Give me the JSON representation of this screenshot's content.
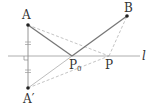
{
  "diagram": {
    "colors": {
      "line": "#999999",
      "solid_path": "#777777",
      "dashed": "#aaaaaa",
      "point": "#222222",
      "text": "#333333"
    },
    "points": {
      "A": {
        "label": "A",
        "x": 28,
        "y": 25
      },
      "A_prime": {
        "label": "A′",
        "x": 28,
        "y": 88
      },
      "B": {
        "label": "B",
        "x": 127,
        "y": 16
      },
      "P0": {
        "label": "P",
        "sub": "0",
        "x": 72,
        "y": 56
      },
      "P": {
        "label": "P",
        "x": 109,
        "y": 56
      }
    },
    "line_l": {
      "label": "l",
      "x1": 8,
      "x2": 140,
      "y": 56
    },
    "segments": [
      {
        "from": "A",
        "to": "P0",
        "style": "solid"
      },
      {
        "from": "P0",
        "to": "B",
        "style": "solid"
      },
      {
        "from": "A",
        "to": "A_prime",
        "style": "solid-thin"
      },
      {
        "from": "A",
        "to": "P",
        "style": "dashed"
      },
      {
        "from": "P",
        "to": "B",
        "style": "dashed"
      },
      {
        "from": "A_prime",
        "to": "P0",
        "style": "thin"
      },
      {
        "from": "A_prime",
        "to": "P",
        "style": "dashed"
      }
    ],
    "marks": {
      "right_angle_at": "intersection of AA′ and l",
      "equal_ticks": [
        "A to l",
        "l to A′"
      ]
    }
  }
}
